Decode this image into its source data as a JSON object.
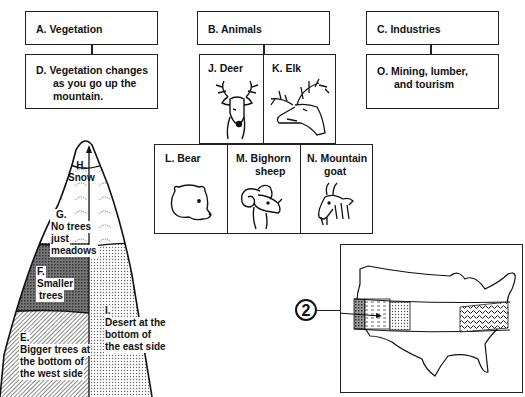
{
  "diagram": {
    "top_boxes": {
      "vegetation": "A.  Vegetation",
      "animals": "B.  Animals",
      "industries": "C.  Industries"
    },
    "detail_boxes": {
      "vegetation_detail": [
        "D.  Vegetation changes",
        "as you go up the",
        "mountain."
      ],
      "industries_detail": [
        "O.  Mining, lumber,",
        "and tourism"
      ]
    },
    "animals": [
      {
        "label": "J.  Deer",
        "icon": "deer-icon"
      },
      {
        "label": "K.  Elk",
        "icon": "elk-icon"
      },
      {
        "label": "L.  Bear",
        "icon": "bear-icon"
      },
      {
        "label": "M.  Bighorn sheep",
        "line1": "M.  Bighorn",
        "line2": "sheep",
        "icon": "bighorn-sheep-icon"
      },
      {
        "label": "N. Mountain goat",
        "line1": "N. Mountain",
        "line2": "goat",
        "icon": "mountain-goat-icon"
      }
    ],
    "mountain": {
      "zones": [
        {
          "letter": "H.",
          "text": "Snow"
        },
        {
          "letter": "G.",
          "text1": "No trees",
          "text2": "just",
          "text3": "meadows"
        },
        {
          "letter": "F.",
          "text1": "Smaller",
          "text2": "trees"
        },
        {
          "letter": "E.",
          "text1": "Bigger trees at",
          "text2": "the bottom of",
          "text3": "the west side"
        },
        {
          "letter": "I.",
          "text1": "Desert at the",
          "text2": "bottom of",
          "text3": "the east side"
        }
      ]
    },
    "map": {
      "marker": "2",
      "subject": "United States outline with a horizontal cross-section band"
    }
  }
}
